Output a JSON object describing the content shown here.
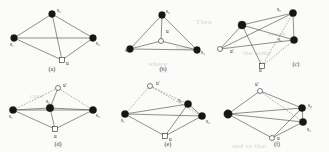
{
  "figure": {
    "vertex_labels": {
      "s1": "s₁",
      "s2": "s₂",
      "s3": "s₃",
      "u": "u",
      "uprime": "u′"
    },
    "node_kinds": {
      "filled": "filled-circle",
      "open": "open-circle",
      "square": "open-square"
    }
  },
  "ghost_text": [
    {
      "text": "Then",
      "x": 196,
      "y": 18
    },
    {
      "text": "break",
      "x": 268,
      "y": 30
    },
    {
      "text": "hence",
      "x": 176,
      "y": 44
    },
    {
      "text": "the same",
      "x": 243,
      "y": 49
    },
    {
      "text": "where",
      "x": 148,
      "y": 60
    },
    {
      "text": "case",
      "x": 30,
      "y": 92
    },
    {
      "text": "of",
      "x": 306,
      "y": 104
    },
    {
      "text": "and so that",
      "x": 232,
      "y": 142
    }
  ],
  "panels": [
    {
      "id": "a",
      "caption": "(a)",
      "caption_x": 52,
      "caption_y": 71,
      "x": 0,
      "y": 0,
      "w": 110,
      "h": 76,
      "nodes": [
        {
          "name": "s2",
          "label": "s₂",
          "kind": "filled",
          "x": 52,
          "y": 14,
          "r": 3.4,
          "lx": 57,
          "ly": 12
        },
        {
          "name": "s1",
          "label": "s₁",
          "kind": "filled",
          "x": 14,
          "y": 38,
          "r": 3.4,
          "lx": 10,
          "ly": 46
        },
        {
          "name": "s3",
          "label": "s₃",
          "kind": "filled",
          "x": 93,
          "y": 38,
          "r": 3.4,
          "lx": 96,
          "ly": 45
        },
        {
          "name": "u",
          "label": "u",
          "kind": "square",
          "x": 62,
          "y": 60,
          "r": 2.6,
          "lx": 66,
          "ly": 65
        }
      ],
      "edges": [
        {
          "from": "s1",
          "to": "s2",
          "style": "solid"
        },
        {
          "from": "s2",
          "to": "s3",
          "style": "solid"
        },
        {
          "from": "s1",
          "to": "s3",
          "style": "solid"
        },
        {
          "from": "s1",
          "to": "u",
          "style": "solid"
        },
        {
          "from": "s3",
          "to": "u",
          "style": "solid"
        },
        {
          "from": "s2",
          "to": "u",
          "style": "solid"
        }
      ]
    },
    {
      "id": "b",
      "caption": "(b)",
      "caption_x": 163,
      "caption_y": 71,
      "x": 110,
      "y": 0,
      "w": 105,
      "h": 76,
      "nodes": [
        {
          "name": "s2",
          "label": "s₂",
          "kind": "filled",
          "x": 52,
          "y": 15,
          "r": 3.4,
          "lx": 56,
          "ly": 13
        },
        {
          "name": "s1",
          "label": "s₁",
          "kind": "filled",
          "x": 20,
          "y": 49,
          "r": 3.4,
          "lx": 15,
          "ly": 52
        },
        {
          "name": "s3",
          "label": "s₃",
          "kind": "filled",
          "x": 87,
          "y": 50,
          "r": 3.4,
          "lx": 91,
          "ly": 54
        },
        {
          "name": "u",
          "label": "u",
          "kind": "open",
          "x": 51,
          "y": 41,
          "r": 2.5,
          "lx": 56,
          "ly": 33
        }
      ],
      "edges": [
        {
          "from": "s1",
          "to": "s2",
          "style": "solid"
        },
        {
          "from": "s2",
          "to": "s3",
          "style": "solid"
        },
        {
          "from": "s1",
          "to": "s3",
          "style": "solid"
        },
        {
          "from": "s1",
          "to": "u",
          "style": "solid"
        },
        {
          "from": "s3",
          "to": "u",
          "style": "solid"
        },
        {
          "from": "s2",
          "to": "u",
          "style": "solid"
        }
      ]
    },
    {
      "id": "c",
      "caption": "(c)",
      "caption_x": 296,
      "caption_y": 66,
      "x": 215,
      "y": 0,
      "w": 114,
      "h": 76,
      "nodes": [
        {
          "name": "s2",
          "label": "s₂",
          "kind": "filled",
          "x": 78,
          "y": 13,
          "r": 3.6,
          "lx": 62,
          "ly": 11
        },
        {
          "name": "s1",
          "label": "",
          "kind": "filled",
          "x": 27,
          "y": 25,
          "r": 4.0,
          "lx": 0,
          "ly": 0
        },
        {
          "name": "s3",
          "label": "s₃",
          "kind": "filled",
          "x": 79,
          "y": 40,
          "r": 3.6,
          "lx": 63,
          "ly": 41
        },
        {
          "name": "uprime",
          "label": "u′",
          "kind": "open",
          "x": 5,
          "y": 49,
          "r": 2.5,
          "lx": 15,
          "ly": 53
        },
        {
          "name": "u",
          "label": "u",
          "kind": "square",
          "x": 47,
          "y": 66,
          "r": 2.5,
          "lx": 44,
          "ly": 72
        }
      ],
      "edges": [
        {
          "from": "s1",
          "to": "s2",
          "style": "solid"
        },
        {
          "from": "s2",
          "to": "s3",
          "style": "solid"
        },
        {
          "from": "s1",
          "to": "s3",
          "style": "solid"
        },
        {
          "from": "s1",
          "to": "uprime",
          "style": "solid"
        },
        {
          "from": "uprime",
          "to": "s2",
          "style": "solid"
        },
        {
          "from": "uprime",
          "to": "s3",
          "style": "solid"
        },
        {
          "from": "s1",
          "to": "u",
          "style": "solid"
        },
        {
          "from": "u",
          "to": "s2",
          "style": "dashed"
        },
        {
          "from": "u",
          "to": "s3",
          "style": "dashed"
        }
      ]
    },
    {
      "id": "d",
      "caption": "(d)",
      "caption_x": 58,
      "caption_y": 146,
      "x": 0,
      "y": 76,
      "w": 110,
      "h": 76,
      "nodes": [
        {
          "name": "uprime",
          "label": "u′",
          "kind": "open",
          "x": 58,
          "y": 12,
          "r": 2.5,
          "lx": 63,
          "ly": 11
        },
        {
          "name": "s1",
          "label": "s₁",
          "kind": "filled",
          "x": 13,
          "y": 34,
          "r": 3.6,
          "lx": 9,
          "ly": 42
        },
        {
          "name": "s2",
          "label": "s₂",
          "kind": "filled",
          "x": 50,
          "y": 32,
          "r": 3.8,
          "lx": 46,
          "ly": 27
        },
        {
          "name": "s3",
          "label": "s₃",
          "kind": "filled",
          "x": 93,
          "y": 34,
          "r": 3.6,
          "lx": 96,
          "ly": 41
        },
        {
          "name": "u",
          "label": "u",
          "kind": "square",
          "x": 55,
          "y": 53,
          "r": 2.5,
          "lx": 54,
          "ly": 62
        }
      ],
      "edges": [
        {
          "from": "s1",
          "to": "s2",
          "style": "solid"
        },
        {
          "from": "s2",
          "to": "s3",
          "style": "solid"
        },
        {
          "from": "s1",
          "to": "s3",
          "style": "solid"
        },
        {
          "from": "s1",
          "to": "uprime",
          "style": "dashed"
        },
        {
          "from": "uprime",
          "to": "s3",
          "style": "dashed"
        },
        {
          "from": "uprime",
          "to": "s2",
          "style": "solid"
        },
        {
          "from": "s1",
          "to": "u",
          "style": "solid"
        },
        {
          "from": "u",
          "to": "s3",
          "style": "solid"
        },
        {
          "from": "u",
          "to": "s2",
          "style": "solid"
        }
      ]
    },
    {
      "id": "e",
      "caption": "(e)",
      "caption_x": 168,
      "caption_y": 146,
      "x": 110,
      "y": 76,
      "w": 105,
      "h": 76,
      "nodes": [
        {
          "name": "uprime",
          "label": "u′",
          "kind": "open",
          "x": 40,
          "y": 10,
          "r": 2.5,
          "lx": 46,
          "ly": 9
        },
        {
          "name": "s1",
          "label": "s₁",
          "kind": "filled",
          "x": 15,
          "y": 38,
          "r": 3.6,
          "lx": 11,
          "ly": 46
        },
        {
          "name": "s2",
          "label": "s₂",
          "kind": "filled",
          "x": 78,
          "y": 28,
          "r": 3.6,
          "lx": 68,
          "ly": 26
        },
        {
          "name": "s3",
          "label": "s₃",
          "kind": "filled",
          "x": 92,
          "y": 40,
          "r": 3.6,
          "lx": 96,
          "ly": 47
        },
        {
          "name": "u",
          "label": "u",
          "kind": "square",
          "x": 55,
          "y": 60,
          "r": 2.5,
          "lx": 59,
          "ly": 65
        }
      ],
      "edges": [
        {
          "from": "s1",
          "to": "s2",
          "style": "solid"
        },
        {
          "from": "s2",
          "to": "s3",
          "style": "solid"
        },
        {
          "from": "s1",
          "to": "s3",
          "style": "solid"
        },
        {
          "from": "s1",
          "to": "uprime",
          "style": "dashed"
        },
        {
          "from": "uprime",
          "to": "s2",
          "style": "dashed"
        },
        {
          "from": "uprime",
          "to": "s3",
          "style": "dashed"
        },
        {
          "from": "s1",
          "to": "u",
          "style": "solid"
        },
        {
          "from": "u",
          "to": "s2",
          "style": "solid"
        },
        {
          "from": "u",
          "to": "s3",
          "style": "solid"
        }
      ]
    },
    {
      "id": "f",
      "caption": "(f)",
      "caption_x": 277,
      "caption_y": 146,
      "x": 215,
      "y": 76,
      "w": 114,
      "h": 76,
      "nodes": [
        {
          "name": "uprime",
          "label": "u′",
          "kind": "open",
          "x": 45,
          "y": 15,
          "r": 2.5,
          "lx": 40,
          "ly": 10
        },
        {
          "name": "s1",
          "label": "",
          "kind": "filled",
          "x": 13,
          "y": 38,
          "r": 4.2,
          "lx": 0,
          "ly": 0
        },
        {
          "name": "s2",
          "label": "s₂",
          "kind": "filled",
          "x": 87,
          "y": 32,
          "r": 3.6,
          "lx": 93,
          "ly": 31
        },
        {
          "name": "s3",
          "label": "s₃",
          "kind": "filled",
          "x": 88,
          "y": 46,
          "r": 3.6,
          "lx": 92,
          "ly": 55
        },
        {
          "name": "u",
          "label": "u",
          "kind": "open",
          "x": 57,
          "y": 62,
          "r": 2.5,
          "lx": 62,
          "ly": 64
        }
      ],
      "edges": [
        {
          "from": "s1",
          "to": "uprime",
          "style": "solid"
        },
        {
          "from": "uprime",
          "to": "s2",
          "style": "solid"
        },
        {
          "from": "uprime",
          "to": "s3",
          "style": "dashed"
        },
        {
          "from": "s1",
          "to": "s2",
          "style": "solid"
        },
        {
          "from": "s1",
          "to": "s3",
          "style": "solid"
        },
        {
          "from": "s2",
          "to": "s3",
          "style": "solid"
        },
        {
          "from": "s1",
          "to": "u",
          "style": "solid"
        },
        {
          "from": "u",
          "to": "s2",
          "style": "solid"
        },
        {
          "from": "u",
          "to": "s3",
          "style": "solid"
        }
      ]
    }
  ]
}
